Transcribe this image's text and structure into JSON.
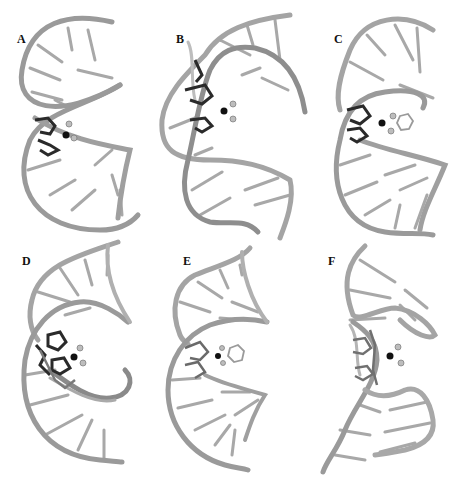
{
  "figure": {
    "panels": [
      {
        "label": "A"
      },
      {
        "label": "B"
      },
      {
        "label": "C"
      },
      {
        "label": "D"
      },
      {
        "label": "E"
      },
      {
        "label": "F"
      }
    ],
    "colors": {
      "backbone": "#9a9a9a",
      "backbone_highlight": "#c8c8c8",
      "base_pair": "#a8a8a8",
      "ligand_dark": "#2a2a2a",
      "ligand_atom": "#bdbdbd",
      "metal_center": "#111111"
    }
  }
}
